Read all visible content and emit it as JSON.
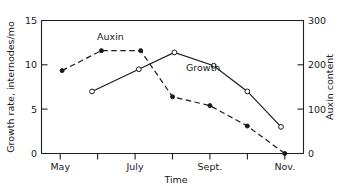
{
  "chart_data": {
    "type": "line",
    "title": "",
    "xlabel": "Time",
    "ylabel": "Growth rate, internodes/mo",
    "y2label": "Auxin content",
    "xlim": [
      0,
      7
    ],
    "ylim": [
      0,
      15
    ],
    "y2lim": [
      0,
      300
    ],
    "grid": false,
    "legend": "inline-annotations",
    "x_tick_labels": [
      "May",
      "July",
      "Sept.",
      "Nov."
    ],
    "x_major_positions": [
      0.5,
      2.5,
      4.5,
      6.5
    ],
    "x_minor_positions": [
      1.5,
      3.5,
      5.5
    ],
    "y_tick_labels": [
      "0",
      "5",
      "10",
      "15"
    ],
    "y_tick_values": [
      0,
      5,
      10,
      15
    ],
    "y2_tick_labels": [
      "0",
      "100",
      "200",
      "300"
    ],
    "y2_tick_values": [
      0,
      100,
      200,
      300
    ],
    "series": [
      {
        "name": "Auxin",
        "axis": "right",
        "style": "dashed",
        "marker": "filled-circle",
        "x": [
          0.55,
          1.6,
          2.65,
          3.5,
          4.5,
          5.5,
          6.5
        ],
        "values": [
          187,
          232,
          232,
          128,
          108,
          62,
          0
        ]
      },
      {
        "name": "Growth",
        "axis": "left",
        "style": "solid",
        "marker": "open-circle",
        "x": [
          1.35,
          2.6,
          3.55,
          4.6,
          5.5,
          6.4
        ],
        "values": [
          7.0,
          9.5,
          11.4,
          9.9,
          7.0,
          3.0
        ]
      }
    ],
    "annotations": [
      {
        "text": "Auxin",
        "x_px": 97,
        "y_px": 40
      },
      {
        "text": "Growth",
        "x_px": 186,
        "y_px": 71
      }
    ]
  },
  "axes": {
    "left_title": "Growth rate, internodes/mo",
    "right_title": "Auxin content",
    "bottom_title": "Time"
  },
  "labels": {
    "y_15": "15",
    "y_10": "10",
    "y_5": "5",
    "y_0": "0",
    "y2_300": "300",
    "y2_200": "200",
    "y2_100": "100",
    "y2_0": "0",
    "x_may": "May",
    "x_july": "July",
    "x_sept": "Sept.",
    "x_nov": "Nov.",
    "series_auxin": "Auxin",
    "series_growth": "Growth"
  }
}
